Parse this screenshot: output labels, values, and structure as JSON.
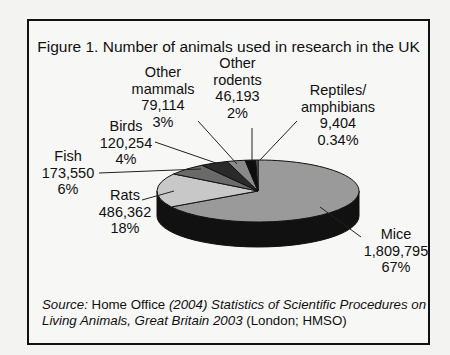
{
  "figure": {
    "title": "Figure 1. Number of animals used in research in the UK",
    "source": {
      "label": "Source:",
      "publisher": "Home Office",
      "italic_part_1": "(2004) Statistics of Scientific Procedures on",
      "italic_part_2": "Living Animals, Great Britain 2003",
      "trailing": "(London; HMSO)"
    }
  },
  "labels": {
    "mice": {
      "name": "Mice",
      "count": "1,809,795",
      "pct": "67%"
    },
    "rats": {
      "name": "Rats",
      "count": "486,362",
      "pct": "18%"
    },
    "fish": {
      "name": "Fish",
      "count": "173,550",
      "pct": "6%"
    },
    "birds": {
      "name": "Birds",
      "count": "120,254",
      "pct": "4%"
    },
    "other_mammals": {
      "name_1": "Other",
      "name_2": "mammals",
      "count": "79,114",
      "pct": "3%"
    },
    "other_rodents": {
      "name_1": "Other",
      "name_2": "rodents",
      "count": "46,193",
      "pct": "2%"
    },
    "reptiles": {
      "name_1": "Reptiles/",
      "name_2": "amphibians",
      "count": "9,404",
      "pct": "0.34%"
    }
  },
  "chart_data": {
    "type": "pie",
    "title": "Figure 1. Number of animals used in research in the UK",
    "style": "3D pie, grayscale",
    "categories": [
      "Mice",
      "Rats",
      "Fish",
      "Birds",
      "Other mammals",
      "Other rodents",
      "Reptiles/amphibians"
    ],
    "values": [
      1809795,
      486362,
      173550,
      120254,
      79114,
      46193,
      9404
    ],
    "percentages": [
      67,
      18,
      6,
      4,
      3,
      2,
      0.34
    ],
    "colors": [
      "#9a9a9a",
      "#c8c8c8",
      "#6a6a6a",
      "#2a2a2a",
      "#8a8a8a",
      "#0e0e0e",
      "#7a7a7a"
    ],
    "legend": "none (direct labels with leader lines)",
    "source": "Home Office (2004) Statistics of Scientific Procedures on Living Animals, Great Britain 2003 (London; HMSO)"
  }
}
